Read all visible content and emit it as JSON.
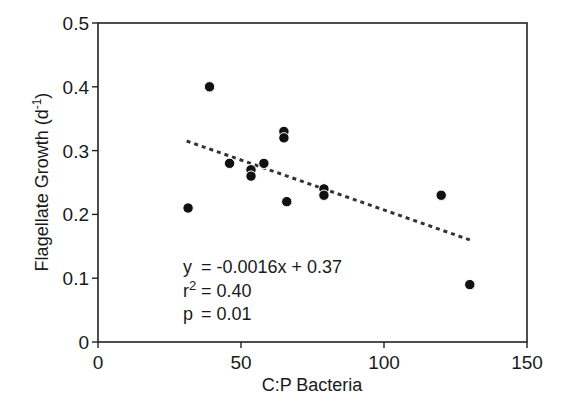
{
  "chart_data": {
    "type": "scatter",
    "title": "",
    "xlabel": "C:P Bacteria",
    "ylabel": "Flagellate Growth (d-1)",
    "ylabel_parts": {
      "main": "Flagellate Growth (d",
      "sup": "-1",
      "close": ")"
    },
    "xlim": [
      0,
      150
    ],
    "ylim": [
      0,
      0.5
    ],
    "x_ticks": [
      0,
      50,
      100,
      150
    ],
    "x_tick_labels": [
      "0",
      "50",
      "100",
      "150"
    ],
    "y_ticks": [
      0,
      0.1,
      0.2,
      0.3,
      0.4,
      0.5
    ],
    "y_tick_labels": [
      "0",
      "0.1",
      "0.2",
      "0.3",
      "0.4",
      "0.5"
    ],
    "grid": false,
    "legend": null,
    "series": [
      {
        "name": "observations",
        "marker": "filled-circle",
        "color": "#111111",
        "points": [
          {
            "x": 31.5,
            "y": 0.21
          },
          {
            "x": 39,
            "y": 0.4
          },
          {
            "x": 46,
            "y": 0.28
          },
          {
            "x": 53.5,
            "y": 0.27
          },
          {
            "x": 53.5,
            "y": 0.26
          },
          {
            "x": 58,
            "y": 0.28
          },
          {
            "x": 65,
            "y": 0.33
          },
          {
            "x": 65,
            "y": 0.32
          },
          {
            "x": 66,
            "y": 0.22
          },
          {
            "x": 79,
            "y": 0.24
          },
          {
            "x": 79,
            "y": 0.23
          },
          {
            "x": 120,
            "y": 0.23
          },
          {
            "x": 130,
            "y": 0.09
          }
        ]
      }
    ],
    "regression": {
      "style": "dotted",
      "color": "#333333",
      "x_range": [
        31,
        130
      ],
      "slope": -0.0016,
      "intercept": 0.37,
      "y_start": 0.315,
      "y_end": 0.16
    },
    "annotations": [
      {
        "label": "y",
        "value": "= -0.0016x + 0.37"
      },
      {
        "label": "r",
        "sup": "2",
        "value": "= 0.40"
      },
      {
        "label": "p",
        "value": "= 0.01"
      }
    ]
  }
}
